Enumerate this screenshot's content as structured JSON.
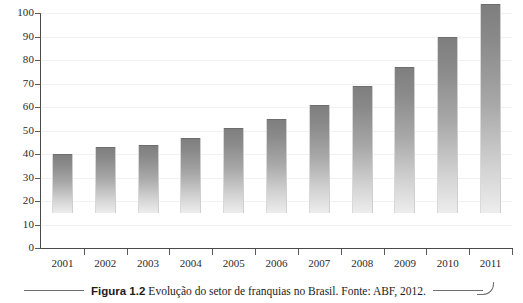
{
  "figure": {
    "caption_label": "Figura 1.2",
    "caption_text": "Evolução do setor de franquias no Brasil. Fonte: ABF, 2012."
  },
  "chart_data": {
    "type": "bar",
    "title": "",
    "subtitle": "",
    "xlabel": "",
    "ylabel": "",
    "categories": [
      "2001",
      "2002",
      "2003",
      "2004",
      "2005",
      "2006",
      "2007",
      "2008",
      "2009",
      "2010",
      "2011"
    ],
    "values": [
      25,
      28,
      29,
      32,
      36,
      40,
      46,
      54,
      62,
      75,
      89
    ],
    "series": [
      {
        "name": "Evolução do setor de franquias no Brasil",
        "values": [
          25,
          28,
          29,
          32,
          36,
          40,
          46,
          54,
          62,
          75,
          89
        ]
      }
    ],
    "ylim": [
      0,
      100
    ],
    "ytick_labels": [
      "0",
      "10",
      "20",
      "30",
      "40",
      "50",
      "60",
      "70",
      "80",
      "90",
      "100"
    ],
    "ytick_values": [
      0,
      10,
      20,
      30,
      40,
      50,
      60,
      70,
      80,
      90,
      100
    ],
    "grid": true,
    "legend": false,
    "legend_position": "none",
    "bar_color_top": "#7e7e7e",
    "bar_color_bottom": "#ededed",
    "axis_color": "#4a4a4a",
    "gridline_color": "#f1f1f1"
  }
}
